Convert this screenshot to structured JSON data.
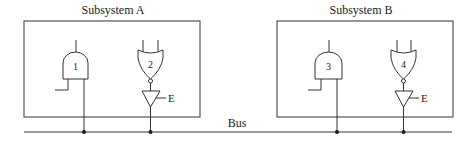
{
  "diagram": {
    "colors": {
      "line": "#333333",
      "background": "#ffffff",
      "text": "#222222"
    },
    "subsystems": [
      {
        "label": "Subsystem A",
        "gates": [
          {
            "id": "1",
            "type": "AND",
            "label": "1"
          },
          {
            "id": "2",
            "type": "NOR",
            "label": "2",
            "buffer": {
              "type": "tri-state buffer",
              "enable_label": "E"
            }
          }
        ]
      },
      {
        "label": "Subsystem B",
        "gates": [
          {
            "id": "3",
            "type": "AND",
            "label": "3"
          },
          {
            "id": "4",
            "type": "NOR",
            "label": "4",
            "buffer": {
              "type": "tri-state buffer",
              "enable_label": "E"
            }
          }
        ]
      }
    ],
    "bus": {
      "label": "Bus"
    }
  }
}
